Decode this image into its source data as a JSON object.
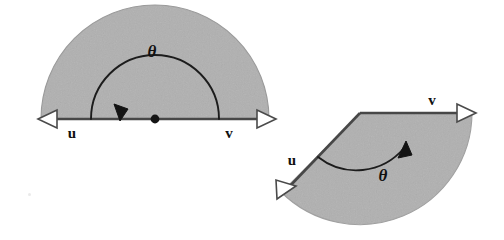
{
  "figure": {
    "background_color": "#ffffff",
    "sector_fill_color": "#b0b0b0",
    "sector_edge_color": "#5a5a5a",
    "stroke_color": "#3a3a3a",
    "label_color": "#111111"
  },
  "left_diagram": {
    "name": "straight-angle-diagram",
    "description": "Semicircular shaded region spanned by a straight angle; vectors u and v point in opposite directions along one line.",
    "vector_u_label": "u",
    "vector_v_label": "v",
    "angle_label": "θ",
    "angle_degrees": 180,
    "vertex": {
      "x": 155,
      "y": 119
    },
    "radius": 114,
    "u_tip": {
      "x": 45,
      "y": 119
    },
    "v_tip": {
      "x": 272,
      "y": 119
    },
    "arc_sweep_direction": "counterclockwise-from-v-to-u",
    "arc_radius": 64,
    "arc_arrow_at": "u"
  },
  "right_diagram": {
    "name": "acute-obtuse-angle-diagram",
    "description": "Circular sector shaded between vector u directed down-left and vector v directed right, with theta measured from u to v.",
    "vector_u_label": "u",
    "vector_v_label": "v",
    "angle_label": "θ",
    "angle_degrees": 134,
    "vertex": {
      "x": 360,
      "y": 113
    },
    "radius": 112,
    "u_tip": {
      "x": 280,
      "y": 196
    },
    "v_tip": {
      "x": 470,
      "y": 113
    },
    "arc_sweep_direction": "counterclockwise-from-u-to-v",
    "arc_radius": 62,
    "arc_arrow_at": "v"
  },
  "labels": {
    "left_u": "u",
    "left_v": "v",
    "left_theta": "θ",
    "right_u": "u",
    "right_v": "v",
    "right_theta": "θ"
  }
}
